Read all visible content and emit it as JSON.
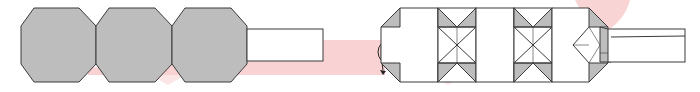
{
  "diagram": {
    "type": "origami-fold-step",
    "colors": {
      "gray_fill": "#bdbdbd",
      "outline": "#3a3a3a",
      "white_fill": "#ffffff",
      "pink_band": "#f7c9c9",
      "crease": "#555555"
    },
    "left_model": {
      "octagons": [
        {
          "cx": 58,
          "cy": 45,
          "label": ""
        },
        {
          "cx": 134,
          "cy": 45,
          "label": ""
        },
        {
          "cx": 210,
          "cy": 45,
          "label": ""
        }
      ],
      "strip": {
        "x": 247,
        "y": 29,
        "w": 76,
        "h": 32
      }
    },
    "symbol": {
      "name": "turn-over",
      "cx": 390,
      "cy": 52,
      "r": 12
    },
    "right_model": {
      "segments": [
        "panel",
        "x-crease",
        "panel",
        "x-crease",
        "panel-with-point"
      ],
      "strip": {
        "x": 608,
        "y": 29,
        "w": 77,
        "h": 33
      }
    }
  }
}
